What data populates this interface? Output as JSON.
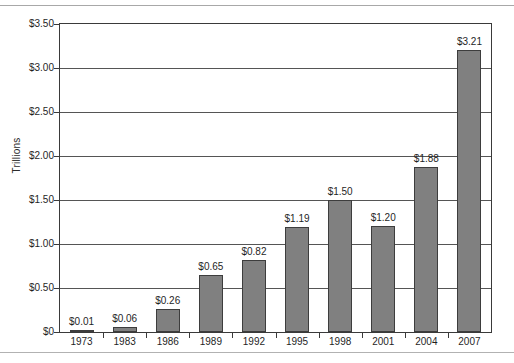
{
  "chart_data": {
    "type": "bar",
    "title": "",
    "subtitle": "",
    "xlabel": "",
    "ylabel": "Trillions",
    "categories": [
      "1973",
      "1983",
      "1986",
      "1989",
      "1992",
      "1995",
      "1998",
      "2001",
      "2004",
      "2007"
    ],
    "values": [
      0.01,
      0.06,
      0.26,
      0.65,
      0.82,
      1.19,
      1.5,
      1.2,
      1.88,
      3.21
    ],
    "data_labels": [
      "$0.01",
      "$0.06",
      "$0.26",
      "$0.65",
      "$0.82",
      "$1.19",
      "$1.50",
      "$1.20",
      "$1.88",
      "$3.21"
    ],
    "ylim": [
      0,
      3.5
    ],
    "ytick_values": [
      0,
      0.5,
      1.0,
      1.5,
      2.0,
      2.5,
      3.0,
      3.5
    ],
    "ytick_labels": [
      "$0",
      "$0.50",
      "$1.00",
      "$1.50",
      "$2.00",
      "$2.50",
      "$3.00",
      "$3.50"
    ],
    "grid": true,
    "legend": "none",
    "bar_color": "#808080",
    "bar_border_color": "#3d3d3d",
    "axis_color": "#3a3a3a",
    "gridline_color": "#555555",
    "text_color": "#1f1f1f",
    "background": "#ffffff"
  }
}
